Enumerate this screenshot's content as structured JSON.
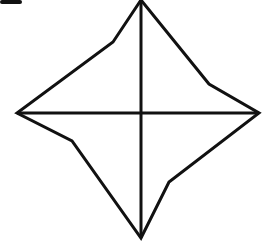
{
  "diagram": {
    "type": "geometric-figure",
    "stroke_color": "#111111",
    "background_color": "#ffffff",
    "star_outline_points": [
      [
        141,
        0
      ],
      [
        113,
        42
      ],
      [
        17,
        113
      ],
      [
        72,
        141
      ],
      [
        141,
        238
      ],
      [
        169,
        182
      ],
      [
        259,
        113
      ],
      [
        209,
        84
      ]
    ],
    "horizontal_line": {
      "x1": 17,
      "y1": 113,
      "x2": 259,
      "y2": 113
    },
    "vertical_line": {
      "x1": 141,
      "y1": 0,
      "x2": 141,
      "y2": 238
    },
    "top_left_fragment": {
      "x": 0,
      "y": 0,
      "width": 22,
      "height": 4
    }
  }
}
